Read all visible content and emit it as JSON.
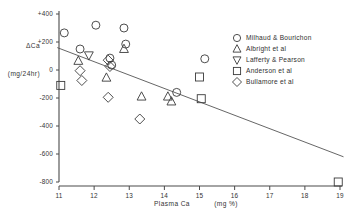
{
  "chart_data": {
    "type": "scatter",
    "title": "",
    "xlabel": "Plasma Ca",
    "xunit": "(mg %)",
    "ylabel": "ΔCa",
    "yunit": "(mg/24hr)",
    "xlim": [
      10.7,
      19.3
    ],
    "ylim": [
      -880,
      460
    ],
    "xticks": [
      11,
      12,
      13,
      14,
      15,
      16,
      17,
      18,
      19
    ],
    "xtick_labels": [
      "11",
      "12",
      "13",
      "14",
      "15",
      "16",
      "17",
      "18",
      "19"
    ],
    "yticks": [
      400,
      200,
      0,
      -200,
      -400,
      -600,
      -800
    ],
    "ytick_labels": [
      "+400",
      "+200",
      "0",
      "-200",
      "-400",
      "-600",
      "-800"
    ],
    "grid": false,
    "legend_position": "top-right",
    "trend_line": {
      "x_start": 10.95,
      "y_start": 160,
      "x_end": 19.1,
      "y_end": -620
    },
    "series": [
      {
        "name": "Milhaud & Bourichon",
        "marker": "circle",
        "points": [
          [
            11.15,
            265
          ],
          [
            11.6,
            150
          ],
          [
            12.05,
            320
          ],
          [
            12.45,
            85
          ],
          [
            12.5,
            35
          ],
          [
            12.85,
            300
          ],
          [
            12.9,
            185
          ],
          [
            14.35,
            -160
          ],
          [
            15.15,
            80
          ]
        ]
      },
      {
        "name": "Albright et al",
        "marker": "triangle-up",
        "points": [
          [
            11.55,
            65
          ],
          [
            12.35,
            -55
          ],
          [
            12.85,
            150
          ],
          [
            13.35,
            -190
          ],
          [
            14.1,
            -190
          ],
          [
            14.2,
            -225
          ]
        ]
      },
      {
        "name": "Lafferty & Pearson",
        "marker": "triangle-down",
        "points": [
          [
            11.85,
            105
          ]
        ]
      },
      {
        "name": "Anderson et al",
        "marker": "square",
        "points": [
          [
            11.05,
            -110
          ],
          [
            15.0,
            -50
          ],
          [
            15.05,
            -205
          ],
          [
            18.95,
            -800
          ]
        ]
      },
      {
        "name": "Bullamore et al",
        "marker": "diamond",
        "points": [
          [
            11.6,
            -5
          ],
          [
            11.65,
            -75
          ],
          [
            12.4,
            70
          ],
          [
            12.45,
            25
          ],
          [
            12.4,
            -195
          ],
          [
            13.3,
            -350
          ]
        ]
      }
    ]
  },
  "legend": {
    "items": [
      {
        "marker": "circle",
        "label": "Milhaud & Bourichon"
      },
      {
        "marker": "triangle-up",
        "label": "Albright et al"
      },
      {
        "marker": "triangle-down",
        "label": "Lafferty & Pearson"
      },
      {
        "marker": "square",
        "label": "Anderson et al"
      },
      {
        "marker": "diamond",
        "label": "Bullamore et al"
      }
    ]
  },
  "colors": {
    "background": "#ffffff",
    "axis": "#4a4a4a",
    "marker": "#3a3a3a",
    "trend": "#555555",
    "text": "#333333"
  }
}
